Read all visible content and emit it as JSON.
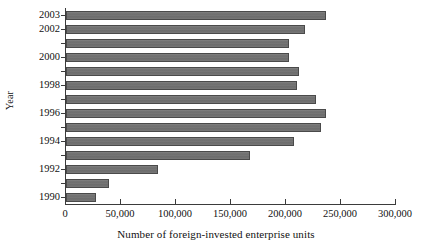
{
  "chart_data": {
    "type": "bar",
    "orientation": "horizontal",
    "title": "",
    "xlabel": "Number of foreign-invested enterprise units",
    "ylabel": "Year",
    "xlim": [
      0,
      300000
    ],
    "ylim": [
      1989.5,
      2003.5
    ],
    "grid": false,
    "legend": null,
    "xticks": [
      0,
      50000,
      100000,
      150000,
      200000,
      250000,
      300000
    ],
    "xtick_labels": [
      "0",
      "50,000",
      "100,000",
      "150,000",
      "200,000",
      "250,000",
      "300,000"
    ],
    "ytick_labels": [
      "2003",
      "2002",
      "2000",
      "1998",
      "1996",
      "1994",
      "1992",
      "1990"
    ],
    "categories": [
      "2003",
      "2002",
      "2001",
      "2000",
      "1999",
      "1998",
      "1997",
      "1996",
      "1995",
      "1994",
      "1993",
      "1992",
      "1991",
      "1990"
    ],
    "values": [
      236000,
      217000,
      203000,
      203000,
      212000,
      210000,
      227000,
      236000,
      232000,
      207000,
      167000,
      84000,
      39000,
      27000
    ],
    "bar_color": "#6e6e6e",
    "bar_edge_color": "#4a4a4a",
    "axis_color": "#3b3b3b",
    "background_color": "#ffffff"
  }
}
